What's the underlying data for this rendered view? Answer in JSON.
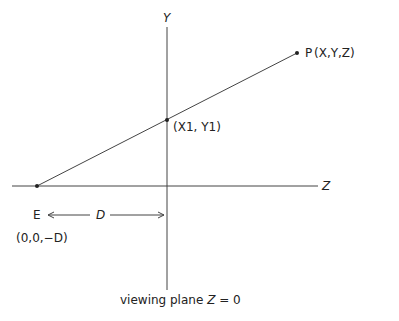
{
  "diagram": {
    "type": "perspective-projection",
    "colors": {
      "line": "#444444",
      "text": "#222222",
      "background": "#ffffff"
    },
    "axes": {
      "y": {
        "label": "Y"
      },
      "z": {
        "label": "Z"
      }
    },
    "points": {
      "eye": {
        "name": "E",
        "coords": "(0,0,−D)"
      },
      "projection": {
        "coords": "(X1, Y1)"
      },
      "target": {
        "name": "P",
        "coords": "(X,Y,Z)"
      }
    },
    "distance": {
      "label": "D"
    },
    "caption": {
      "text": "viewing plane",
      "equation_var": "Z",
      "equation_rest": "= 0"
    }
  }
}
